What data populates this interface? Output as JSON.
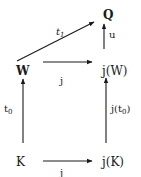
{
  "diagram": {
    "type": "commutative-diagram",
    "nodes": {
      "Q": "Q",
      "W": "W",
      "jW": "j(W)",
      "K": "K",
      "jK": "j(K)"
    },
    "edges": [
      {
        "from": "W",
        "to": "Q",
        "label": "t",
        "label_sub": "1"
      },
      {
        "from": "jW",
        "to": "Q",
        "label": "u"
      },
      {
        "from": "W",
        "to": "jW",
        "label": "j"
      },
      {
        "from": "K",
        "to": "W",
        "label": "t",
        "label_sub": "0"
      },
      {
        "from": "jK",
        "to": "jW",
        "label_prefix": "j(t",
        "label_sub": "0",
        "label_suffix": ")"
      },
      {
        "from": "K",
        "to": "jK",
        "label": "j"
      }
    ]
  }
}
